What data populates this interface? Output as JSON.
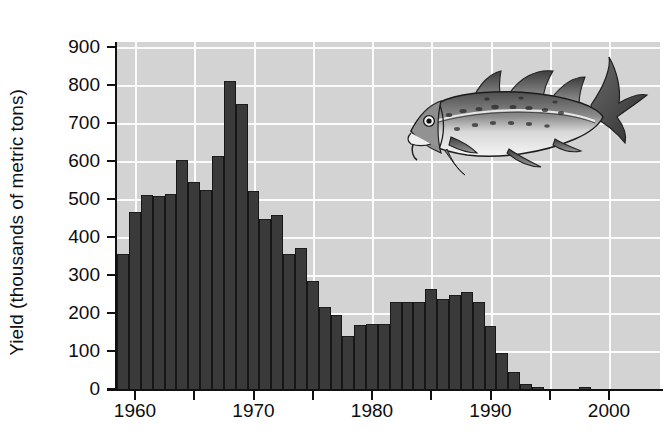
{
  "chart_data": {
    "type": "bar",
    "title": "",
    "subtitle": "",
    "xlabel": "",
    "ylabel": "Yield (thousands of metric tons)",
    "xlim": [
      1958.5,
      2001.5
    ],
    "ylim": [
      0,
      950
    ],
    "grid": true,
    "legend": null,
    "y_ticks": [
      0,
      100,
      200,
      300,
      400,
      500,
      600,
      700,
      800,
      900
    ],
    "y_tick_labels": [
      "0",
      "100",
      "200",
      "300",
      "400",
      "500",
      "600",
      "700",
      "800",
      "900"
    ],
    "x_ticks": [
      1960,
      1965,
      1970,
      1975,
      1980,
      1985,
      1990,
      1995,
      2000
    ],
    "x_tick_labels": [
      "1960",
      "",
      "1970",
      "",
      "1980",
      "",
      "1990",
      "",
      "2000"
    ],
    "x_tick_labels_shown": [
      "1960",
      "1970",
      "1980",
      "1990",
      "2000"
    ],
    "bar_color": "#3a3a3a",
    "plot_background": "#d3d3d3",
    "gridline_color": "#fbfbfb",
    "categories": [
      1959,
      1960,
      1961,
      1962,
      1963,
      1964,
      1965,
      1966,
      1967,
      1968,
      1969,
      1970,
      1971,
      1972,
      1973,
      1974,
      1975,
      1976,
      1977,
      1978,
      1979,
      1980,
      1981,
      1982,
      1983,
      1984,
      1985,
      1986,
      1987,
      1988,
      1989,
      1990,
      1991,
      1992,
      1993,
      1994,
      1995,
      1996,
      1997,
      1998,
      1999
    ],
    "values": [
      355,
      465,
      510,
      508,
      512,
      603,
      545,
      525,
      612,
      810,
      750,
      520,
      448,
      458,
      355,
      370,
      285,
      215,
      195,
      140,
      168,
      170,
      172,
      230,
      228,
      230,
      262,
      238,
      248,
      255,
      228,
      165,
      95,
      45,
      12,
      2,
      0,
      0,
      0,
      6,
      0
    ],
    "annotation_icon": "atlantic-cod-fish-illustration"
  },
  "axis": {
    "y_title": "Yield (thousands of metric tons)"
  }
}
